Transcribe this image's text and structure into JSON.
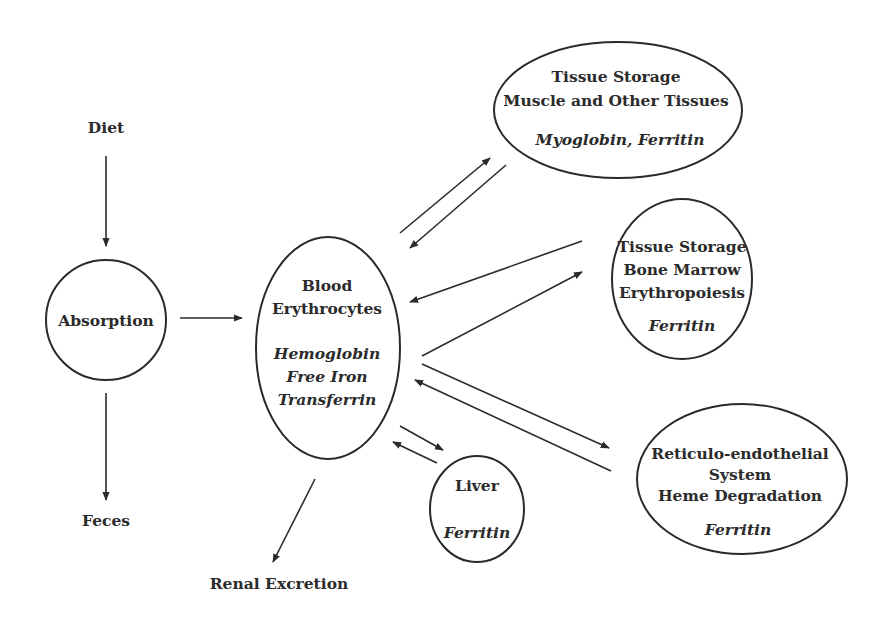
{
  "diagram": {
    "nodes": {
      "diet": {
        "label": "Diet"
      },
      "absorption": {
        "label": "Absorption"
      },
      "feces": {
        "label": "Feces"
      },
      "blood": {
        "lines": [
          "Blood",
          "Erythrocytes"
        ],
        "italic_lines": [
          "Hemoglobin",
          "Free Iron",
          "Transferrin"
        ]
      },
      "renal": {
        "label": "Renal Excretion"
      },
      "liver": {
        "lines": [
          "Liver"
        ],
        "italic_lines": [
          "Ferritin"
        ]
      },
      "muscle": {
        "lines": [
          "Tissue Storage",
          "Muscle and Other Tissues"
        ],
        "italic_lines": [
          "Myoglobin, Ferritin"
        ]
      },
      "marrow": {
        "lines": [
          "Tissue Storage",
          "Bone Marrow",
          "Erythropoiesis"
        ],
        "italic_lines": [
          "Ferritin"
        ]
      },
      "res": {
        "lines": [
          "Reticulo-endothelial",
          "System",
          "Heme Degradation"
        ],
        "italic_lines": [
          "Ferritin"
        ]
      }
    },
    "edges": [
      {
        "from": "Diet",
        "to": "Absorption"
      },
      {
        "from": "Absorption",
        "to": "Blood"
      },
      {
        "from": "Absorption",
        "to": "Feces"
      },
      {
        "from": "Blood",
        "to": "Renal Excretion"
      },
      {
        "from": "Blood",
        "to": "Tissue Storage (Muscle)"
      },
      {
        "from": "Tissue Storage (Muscle)",
        "to": "Blood"
      },
      {
        "from": "Blood",
        "to": "Tissue Storage (Bone Marrow)"
      },
      {
        "from": "Tissue Storage (Bone Marrow)",
        "to": "Blood"
      },
      {
        "from": "Blood",
        "to": "Reticulo-endothelial System"
      },
      {
        "from": "Reticulo-endothelial System",
        "to": "Blood"
      },
      {
        "from": "Blood",
        "to": "Liver"
      },
      {
        "from": "Liver",
        "to": "Blood"
      }
    ]
  }
}
